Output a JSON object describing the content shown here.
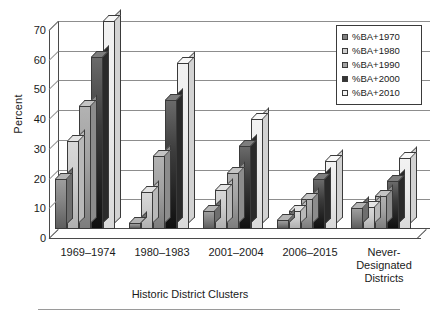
{
  "chart_data": {
    "type": "bar",
    "title": "",
    "xlabel": "Historic District Clusters",
    "ylabel": "Percent",
    "ylim": [
      0,
      70
    ],
    "yticks": [
      0,
      10,
      20,
      30,
      40,
      50,
      60,
      70
    ],
    "grid": true,
    "legend_position": "top-right",
    "categories": [
      "1969–1974",
      "1980–1983",
      "2001–2004",
      "2006–2015",
      "Never-\nDesignated\nDistricts"
    ],
    "series": [
      {
        "name": "%BA+1970",
        "values": [
          17,
          2,
          6,
          3,
          7
        ]
      },
      {
        "name": "%BA+1980",
        "values": [
          29.5,
          12.5,
          13,
          6,
          7.5
        ]
      },
      {
        "name": "%BA+1990",
        "values": [
          41.5,
          24.5,
          19,
          10,
          11
        ]
      },
      {
        "name": "%BA+2000",
        "values": [
          58,
          43.5,
          28,
          17,
          16
        ]
      },
      {
        "name": "%BA+2010",
        "values": [
          70,
          56,
          37,
          23,
          24
        ]
      }
    ],
    "series_colors": [
      "#808080",
      "#cfcfcf",
      "#a3a3a3",
      "#353535",
      "#f3f3f3"
    ]
  },
  "axis": {
    "y_tick_labels": [
      "0",
      "10",
      "20",
      "30",
      "40",
      "50",
      "60",
      "70"
    ],
    "y_title": "Percent",
    "x_title": "Historic District Clusters",
    "x_tick_labels": [
      "1969–1974",
      "1980–1983",
      "2001–2004",
      "2006–2015",
      "Never-\nDesignated\nDistricts"
    ]
  },
  "legend": {
    "items": [
      {
        "label": "%BA+1970"
      },
      {
        "label": "%BA+1980"
      },
      {
        "label": "%BA+1990"
      },
      {
        "label": "%BA+2000"
      },
      {
        "label": "%BA+2010"
      }
    ]
  }
}
